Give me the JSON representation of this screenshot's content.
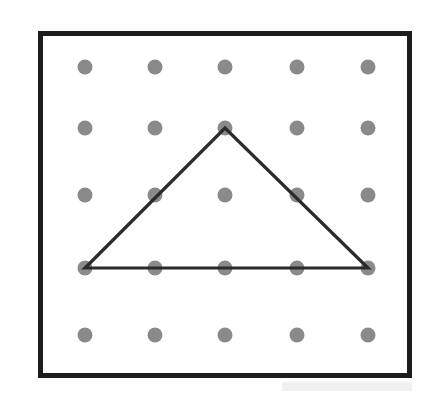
{
  "figure": {
    "name": "geoboard-triangle",
    "canvas": {
      "width": 436,
      "height": 397
    }
  },
  "colors": {
    "background": "#fefefe",
    "board_interior": "#ffffff",
    "frame": "#1c1c1c",
    "peg": "#8a8a8a",
    "peg_edge": "#7e7e7e",
    "band": "#2b2b2b",
    "smudge": "#f0f0f0"
  },
  "board": {
    "label": "geoboard-frame",
    "x": 38,
    "y": 31,
    "width": 374,
    "height": 347,
    "border_width": 5,
    "rows": 5,
    "cols": 5
  },
  "pegs": {
    "radius": 7.5,
    "columns_x": [
      85,
      155,
      225,
      297,
      368
    ],
    "rows_y": [
      67,
      128,
      195,
      268,
      335
    ],
    "count": 25,
    "items": [
      {
        "id": "peg-r1c1",
        "row": 1,
        "col": 1,
        "cx": 85,
        "cy": 67,
        "on_shape": false
      },
      {
        "id": "peg-r1c2",
        "row": 1,
        "col": 2,
        "cx": 155,
        "cy": 67,
        "on_shape": false
      },
      {
        "id": "peg-r1c3",
        "row": 1,
        "col": 3,
        "cx": 225,
        "cy": 67,
        "on_shape": false
      },
      {
        "id": "peg-r1c4",
        "row": 1,
        "col": 4,
        "cx": 297,
        "cy": 67,
        "on_shape": false
      },
      {
        "id": "peg-r1c5",
        "row": 1,
        "col": 5,
        "cx": 368,
        "cy": 67,
        "on_shape": false
      },
      {
        "id": "peg-r2c1",
        "row": 2,
        "col": 1,
        "cx": 85,
        "cy": 128,
        "on_shape": false
      },
      {
        "id": "peg-r2c2",
        "row": 2,
        "col": 2,
        "cx": 155,
        "cy": 128,
        "on_shape": false
      },
      {
        "id": "peg-r2c3",
        "row": 2,
        "col": 3,
        "cx": 225,
        "cy": 128,
        "on_shape": true
      },
      {
        "id": "peg-r2c4",
        "row": 2,
        "col": 4,
        "cx": 297,
        "cy": 128,
        "on_shape": false
      },
      {
        "id": "peg-r2c5",
        "row": 2,
        "col": 5,
        "cx": 368,
        "cy": 128,
        "on_shape": false
      },
      {
        "id": "peg-r3c1",
        "row": 3,
        "col": 1,
        "cx": 85,
        "cy": 195,
        "on_shape": false
      },
      {
        "id": "peg-r3c2",
        "row": 3,
        "col": 2,
        "cx": 155,
        "cy": 195,
        "on_shape": true
      },
      {
        "id": "peg-r3c3",
        "row": 3,
        "col": 3,
        "cx": 225,
        "cy": 195,
        "on_shape": false
      },
      {
        "id": "peg-r3c4",
        "row": 3,
        "col": 4,
        "cx": 297,
        "cy": 195,
        "on_shape": true
      },
      {
        "id": "peg-r3c5",
        "row": 3,
        "col": 5,
        "cx": 368,
        "cy": 195,
        "on_shape": false
      },
      {
        "id": "peg-r4c1",
        "row": 4,
        "col": 1,
        "cx": 85,
        "cy": 268,
        "on_shape": true
      },
      {
        "id": "peg-r4c2",
        "row": 4,
        "col": 2,
        "cx": 155,
        "cy": 268,
        "on_shape": true
      },
      {
        "id": "peg-r4c3",
        "row": 4,
        "col": 3,
        "cx": 225,
        "cy": 268,
        "on_shape": true
      },
      {
        "id": "peg-r4c4",
        "row": 4,
        "col": 4,
        "cx": 297,
        "cy": 268,
        "on_shape": true
      },
      {
        "id": "peg-r4c5",
        "row": 4,
        "col": 5,
        "cx": 368,
        "cy": 268,
        "on_shape": true
      },
      {
        "id": "peg-r5c1",
        "row": 5,
        "col": 1,
        "cx": 85,
        "cy": 335,
        "on_shape": false
      },
      {
        "id": "peg-r5c2",
        "row": 5,
        "col": 2,
        "cx": 155,
        "cy": 335,
        "on_shape": false
      },
      {
        "id": "peg-r5c3",
        "row": 5,
        "col": 3,
        "cx": 225,
        "cy": 335,
        "on_shape": false
      },
      {
        "id": "peg-r5c4",
        "row": 5,
        "col": 4,
        "cx": 297,
        "cy": 335,
        "on_shape": false
      },
      {
        "id": "peg-r5c5",
        "row": 5,
        "col": 5,
        "cx": 368,
        "cy": 335,
        "on_shape": false
      }
    ]
  },
  "shape": {
    "name": "triangle",
    "kind": "isosceles-triangle",
    "stroke_width": 3.2,
    "vertices": [
      {
        "id": "vertex-bottom-left",
        "label": "bottom-left",
        "row": 4,
        "col": 1,
        "x": 85,
        "y": 268
      },
      {
        "id": "vertex-apex",
        "label": "apex",
        "row": 2,
        "col": 3,
        "x": 225,
        "y": 128
      },
      {
        "id": "vertex-bottom-right",
        "label": "bottom-right",
        "row": 4,
        "col": 5,
        "x": 368,
        "y": 268
      }
    ],
    "points_attr": "85,268 225,128 368,268",
    "edges": [
      {
        "id": "edge-left",
        "label": "left-side",
        "x1": 85,
        "y1": 268,
        "x2": 225,
        "y2": 128
      },
      {
        "id": "edge-right",
        "label": "right-side",
        "x1": 225,
        "y1": 128,
        "x2": 368,
        "y2": 268
      },
      {
        "id": "edge-bottom",
        "label": "base",
        "x1": 85,
        "y1": 268,
        "x2": 368,
        "y2": 268
      }
    ]
  },
  "artifacts": {
    "smudge": {
      "x": 282,
      "y": 382,
      "width": 130,
      "height": 9
    }
  }
}
